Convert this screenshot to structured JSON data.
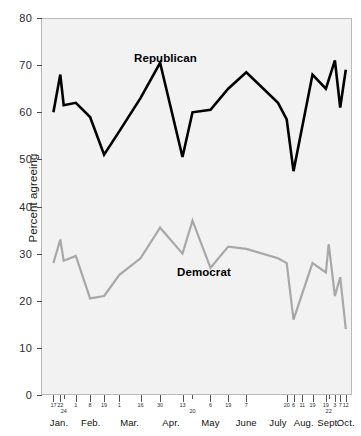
{
  "chart_data": {
    "type": "line",
    "title": "",
    "xlabel": "",
    "ylabel": "Percent agreeing",
    "ylim": [
      0,
      80
    ],
    "yticks": [
      0,
      10,
      20,
      30,
      40,
      50,
      60,
      70,
      80
    ],
    "grid": false,
    "legend_position": "inline-annotation",
    "background": "#f2f2f2",
    "x": [
      "Jan. 17",
      "Jan. 22",
      "Jan. 24",
      "Feb. 1",
      "Feb. 8",
      "Feb. 19",
      "Mar. 1",
      "Mar. 16",
      "Mar. 30",
      "Apr. 13",
      "Apr. 20",
      "May 6",
      "May 19",
      "June 7",
      "July",
      "Aug. 20",
      "Aug. 6",
      "Aug. 11",
      "Aug. 19",
      "Sept. 19",
      "Sept. 22",
      "Oct. 3",
      "Oct. 7",
      "Oct. 12"
    ],
    "xtick_numbers": [
      {
        "label": "17",
        "pos": 0.04,
        "row": 0
      },
      {
        "label": "22",
        "pos": 0.062,
        "row": 0
      },
      {
        "label": "24",
        "pos": 0.073,
        "row": 1
      },
      {
        "label": "1",
        "pos": 0.112,
        "row": 0
      },
      {
        "label": "8",
        "pos": 0.158,
        "row": 0
      },
      {
        "label": "19",
        "pos": 0.203,
        "row": 0
      },
      {
        "label": "1",
        "pos": 0.252,
        "row": 0
      },
      {
        "label": "16",
        "pos": 0.32,
        "row": 0
      },
      {
        "label": "30",
        "pos": 0.383,
        "row": 0
      },
      {
        "label": "13",
        "pos": 0.455,
        "row": 0
      },
      {
        "label": "20",
        "pos": 0.487,
        "row": 1
      },
      {
        "label": "6",
        "pos": 0.545,
        "row": 0
      },
      {
        "label": "19",
        "pos": 0.602,
        "row": 0
      },
      {
        "label": "7",
        "pos": 0.66,
        "row": 0
      },
      {
        "label": "20",
        "pos": 0.79,
        "row": 0
      },
      {
        "label": "6",
        "pos": 0.812,
        "row": 0
      },
      {
        "label": "11",
        "pos": 0.84,
        "row": 0
      },
      {
        "label": "19",
        "pos": 0.873,
        "row": 0
      },
      {
        "label": "19",
        "pos": 0.916,
        "row": 0
      },
      {
        "label": "22",
        "pos": 0.925,
        "row": 1
      },
      {
        "label": "3",
        "pos": 0.945,
        "row": 0
      },
      {
        "label": "7",
        "pos": 0.962,
        "row": 0
      },
      {
        "label": "12",
        "pos": 0.98,
        "row": 0
      }
    ],
    "months": [
      {
        "label": "Jan.",
        "pos": 0.058
      },
      {
        "label": "Feb.",
        "pos": 0.16
      },
      {
        "label": "Mar.",
        "pos": 0.285
      },
      {
        "label": "Apr.",
        "pos": 0.418
      },
      {
        "label": "May",
        "pos": 0.545
      },
      {
        "label": "June",
        "pos": 0.66
      },
      {
        "label": "July",
        "pos": 0.762
      },
      {
        "label": "Aug.",
        "pos": 0.845
      },
      {
        "label": "Sept.",
        "pos": 0.925
      },
      {
        "label": "Oct.",
        "pos": 0.98
      }
    ],
    "series": [
      {
        "name": "Republican",
        "color": "#000000",
        "label_x": 0.33,
        "label_y": 74,
        "points": [
          {
            "x": 0.04,
            "y": 60.0
          },
          {
            "x": 0.062,
            "y": 68.0
          },
          {
            "x": 0.073,
            "y": 61.5
          },
          {
            "x": 0.112,
            "y": 62.0
          },
          {
            "x": 0.158,
            "y": 59.0
          },
          {
            "x": 0.203,
            "y": 51.0
          },
          {
            "x": 0.252,
            "y": 56.0
          },
          {
            "x": 0.32,
            "y": 63.0
          },
          {
            "x": 0.383,
            "y": 70.5
          },
          {
            "x": 0.455,
            "y": 50.5
          },
          {
            "x": 0.487,
            "y": 60.0
          },
          {
            "x": 0.545,
            "y": 60.5
          },
          {
            "x": 0.602,
            "y": 65.0
          },
          {
            "x": 0.66,
            "y": 68.5
          },
          {
            "x": 0.762,
            "y": 62.0
          },
          {
            "x": 0.79,
            "y": 58.5
          },
          {
            "x": 0.812,
            "y": 47.5
          },
          {
            "x": 0.873,
            "y": 68.0
          },
          {
            "x": 0.916,
            "y": 65.0
          },
          {
            "x": 0.945,
            "y": 71.0
          },
          {
            "x": 0.962,
            "y": 61.0
          },
          {
            "x": 0.98,
            "y": 69.0
          }
        ]
      },
      {
        "name": "Democrat",
        "color": "#a8a8a8",
        "label_x": 0.46,
        "label_y": 25,
        "points": [
          {
            "x": 0.04,
            "y": 28.0
          },
          {
            "x": 0.062,
            "y": 33.0
          },
          {
            "x": 0.073,
            "y": 28.5
          },
          {
            "x": 0.112,
            "y": 29.5
          },
          {
            "x": 0.158,
            "y": 20.5
          },
          {
            "x": 0.203,
            "y": 21.0
          },
          {
            "x": 0.252,
            "y": 25.5
          },
          {
            "x": 0.32,
            "y": 29.0
          },
          {
            "x": 0.383,
            "y": 35.5
          },
          {
            "x": 0.455,
            "y": 30.0
          },
          {
            "x": 0.487,
            "y": 37.0
          },
          {
            "x": 0.545,
            "y": 27.0
          },
          {
            "x": 0.602,
            "y": 31.5
          },
          {
            "x": 0.66,
            "y": 31.0
          },
          {
            "x": 0.762,
            "y": 29.0
          },
          {
            "x": 0.79,
            "y": 28.0
          },
          {
            "x": 0.812,
            "y": 16.0
          },
          {
            "x": 0.873,
            "y": 28.0
          },
          {
            "x": 0.916,
            "y": 26.0
          },
          {
            "x": 0.925,
            "y": 32.0
          },
          {
            "x": 0.945,
            "y": 21.0
          },
          {
            "x": 0.962,
            "y": 25.0
          },
          {
            "x": 0.98,
            "y": 14.0
          }
        ]
      }
    ]
  }
}
